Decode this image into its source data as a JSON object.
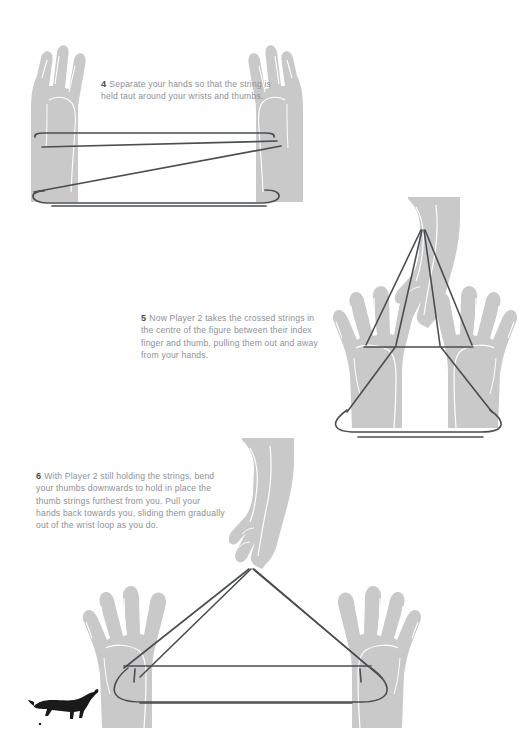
{
  "page": {
    "background_color": "#ffffff",
    "width": 526,
    "height": 736,
    "hand_color": "#c9c9c9",
    "hand_detail_color": "#ffffff",
    "string_color": "#4a4d52",
    "text_color": "#8e9196",
    "number_color": "#4a4d52",
    "cat_color": "#1a1a1a"
  },
  "steps": [
    {
      "number": "4",
      "text": "Separate your hands so that the string is held taut around your wrists and thumbs.",
      "figure_name": "crossed-string-between-two-hands"
    },
    {
      "number": "5",
      "text": "Now Player 2 takes the crossed strings in the centre of the figure between their index finger and thumb, pulling them out and away from your hands.",
      "figure_name": "player-two-pinching-strings-upward"
    },
    {
      "number": "6",
      "text": "With Player 2 still holding the strings, bend your thumbs downwards to hold in place the thumb strings furthest from you. Pull your hands back towards you, sliding them gradually out of the wrist loop as you do.",
      "figure_name": "hands-pulled-back-triangle-figure"
    }
  ],
  "decoration": {
    "cat_label": "leaping-cat-silhouette"
  }
}
